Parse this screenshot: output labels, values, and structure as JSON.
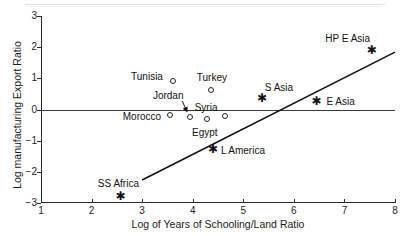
{
  "chart_data": {
    "type": "scatter",
    "title": "",
    "xlabel": "Log of Years of Schooling/Land Ratio",
    "ylabel": "Log manufacturing Export Ratio",
    "xlim": [
      1,
      8
    ],
    "ylim": [
      -3,
      3
    ],
    "xticks": [
      1,
      2,
      3,
      4,
      5,
      6,
      7,
      8
    ],
    "yticks": [
      3,
      2,
      1,
      0,
      -1,
      -2,
      -3
    ],
    "grid": false,
    "legend": "none",
    "zero_line": 0,
    "points": [
      {
        "label": "Tunisia",
        "x": 3.61,
        "y": 0.91,
        "marker": "circle",
        "label_dx": -26,
        "label_dy": -5
      },
      {
        "label": "Turkey",
        "x": 4.36,
        "y": 0.62,
        "marker": "circle",
        "label_dx": 1,
        "label_dy": -13
      },
      {
        "label": "Jordan",
        "x": 3.95,
        "y": -0.24,
        "marker": "circle",
        "label_dx": -22,
        "label_dy": -22
      },
      {
        "label": "Morocco",
        "x": 3.55,
        "y": -0.18,
        "marker": "circle",
        "label_dx": -28,
        "label_dy": 1
      },
      {
        "label": "Egypt",
        "x": 4.28,
        "y": -0.3,
        "marker": "circle",
        "label_dx": -2,
        "label_dy": 13
      },
      {
        "label": "Syria",
        "x": 4.64,
        "y": -0.21,
        "marker": "circle",
        "label_dx": -19,
        "label_dy": -9
      },
      {
        "label": "S Asia",
        "x": 5.37,
        "y": 0.37,
        "marker": "star",
        "label_dx": 17,
        "label_dy": -11
      },
      {
        "label": "E Asia",
        "x": 6.45,
        "y": 0.27,
        "marker": "star",
        "label_dx": 24,
        "label_dy": 0
      },
      {
        "label": "HP E Asia",
        "x": 7.54,
        "y": 1.91,
        "marker": "star",
        "label_dx": -24,
        "label_dy": -12
      },
      {
        "label": "L America",
        "x": 4.4,
        "y": -1.28,
        "marker": "star",
        "label_dx": 30,
        "label_dy": 1
      },
      {
        "label": "SS Africa",
        "x": 2.57,
        "y": -2.77,
        "marker": "star",
        "label_dx": -2,
        "label_dy": -13
      }
    ],
    "fit_line": {
      "x0": 3.0,
      "y0": -2.26,
      "x1": 8.0,
      "y1": 1.84
    }
  }
}
